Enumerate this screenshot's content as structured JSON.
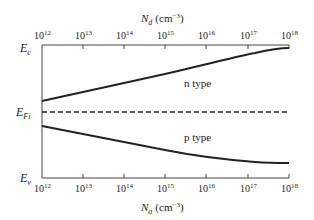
{
  "diagram": {
    "top_axis": {
      "label_var": "N",
      "label_sub": "d",
      "label_unit": "(cm",
      "label_exp": "−3",
      "label_close": ")",
      "ticks": [
        {
          "base": "10",
          "exp": "12"
        },
        {
          "base": "10",
          "exp": "13"
        },
        {
          "base": "10",
          "exp": "14"
        },
        {
          "base": "10",
          "exp": "15"
        },
        {
          "base": "10",
          "exp": "16"
        },
        {
          "base": "10",
          "exp": "17"
        },
        {
          "base": "10",
          "exp": "18"
        }
      ]
    },
    "bottom_axis": {
      "label_var": "N",
      "label_sub": "a",
      "label_unit": "(cm",
      "label_exp": "−3",
      "label_close": ")",
      "ticks": [
        {
          "base": "10",
          "exp": "12"
        },
        {
          "base": "10",
          "exp": "13"
        },
        {
          "base": "10",
          "exp": "14"
        },
        {
          "base": "10",
          "exp": "15"
        },
        {
          "base": "10",
          "exp": "16"
        },
        {
          "base": "10",
          "exp": "17"
        },
        {
          "base": "10",
          "exp": "18"
        }
      ]
    },
    "energy_levels": {
      "Ec": {
        "main": "E",
        "sub": "c"
      },
      "EFi": {
        "main": "E",
        "sub": "Fi"
      },
      "Ev": {
        "main": "E",
        "sub": "v"
      }
    },
    "curves": {
      "n_type": {
        "label": "n type"
      },
      "p_type": {
        "label": "p type"
      }
    },
    "colors": {
      "line": "#222222",
      "axis": "#444444",
      "background": "#ffffff"
    }
  }
}
